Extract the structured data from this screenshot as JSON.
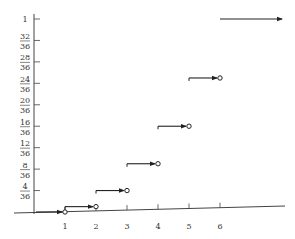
{
  "chart_data": {
    "type": "line",
    "subtype": "step-cdf",
    "title": "",
    "xlabel": "",
    "ylabel": "",
    "x_ticks": [
      "1",
      "2",
      "3",
      "4",
      "5",
      "6"
    ],
    "y_ticks": [
      {
        "num": "4",
        "den": "36",
        "value": 0.1111
      },
      {
        "num": "8",
        "den": "36",
        "value": 0.2222
      },
      {
        "num": "12",
        "den": "36",
        "value": 0.3333
      },
      {
        "num": "16",
        "den": "36",
        "value": 0.4444
      },
      {
        "num": "20",
        "den": "36",
        "value": 0.5556
      },
      {
        "num": "24",
        "den": "36",
        "value": 0.6667
      },
      {
        "num": "28",
        "den": "36",
        "value": 0.7778
      },
      {
        "num": "32",
        "den": "36",
        "value": 0.8889
      },
      {
        "num": "1",
        "den": "",
        "value": 1.0
      }
    ],
    "ylim": [
      0,
      1
    ],
    "xlim": [
      0,
      7
    ],
    "grid": false,
    "segments": [
      {
        "x_start": -1,
        "x_end": 1,
        "y": 0,
        "y_label": "0",
        "closed_left": false,
        "open_right": true
      },
      {
        "x_start": 1,
        "x_end": 2,
        "y": 0.0278,
        "y_label": "1/36",
        "open_right": true
      },
      {
        "x_start": 2,
        "x_end": 3,
        "y": 0.1111,
        "y_label": "4/36",
        "open_right": true
      },
      {
        "x_start": 3,
        "x_end": 4,
        "y": 0.25,
        "y_label": "9/36",
        "open_right": true
      },
      {
        "x_start": 4,
        "x_end": 5,
        "y": 0.4444,
        "y_label": "16/36",
        "open_right": true
      },
      {
        "x_start": 5,
        "x_end": 6,
        "y": 0.6944,
        "y_label": "25/36",
        "open_right": true
      },
      {
        "x_start": 6,
        "x_end": 8,
        "y": 1.0,
        "y_label": "1",
        "open_right": false,
        "arrow_right": true
      }
    ],
    "x": [
      1,
      2,
      3,
      4,
      5,
      6
    ],
    "values": [
      0.0278,
      0.1111,
      0.25,
      0.4444,
      0.6944,
      1.0
    ]
  },
  "colors": {
    "line": "#222222",
    "axis": "#444444",
    "text": "#333333",
    "background": "#ffffff"
  }
}
